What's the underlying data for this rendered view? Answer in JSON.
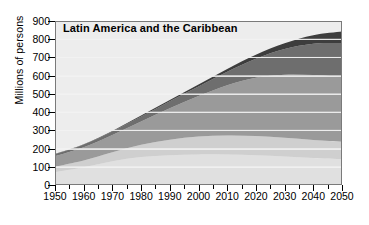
{
  "chart_data": {
    "type": "area",
    "title": "Latin America and the Caribbean",
    "xlabel": "",
    "ylabel": "Millions of persons",
    "xlim": [
      1950,
      2050
    ],
    "ylim": [
      0,
      900
    ],
    "ytick_step": 100,
    "xtick_step": 10,
    "grid": true,
    "stacked": true,
    "legend": "none",
    "xticks": [
      "1950",
      "1960",
      "1970",
      "1980",
      "1990",
      "2000",
      "2010",
      "2020",
      "2030",
      "2040",
      "2050"
    ],
    "yticks": [
      "0",
      "100",
      "200",
      "300",
      "400",
      "500",
      "600",
      "700",
      "800",
      "900"
    ],
    "x": [
      1950,
      1960,
      1970,
      1980,
      1990,
      2000,
      2010,
      2020,
      2030,
      2040,
      2050
    ],
    "series": [
      {
        "name": "age-0-14",
        "color": "#e0e0e0",
        "values": [
          70,
          97,
          130,
          153,
          163,
          168,
          167,
          163,
          156,
          148,
          142
        ]
      },
      {
        "name": "age-15-24",
        "color": "#cfcfcf",
        "values": [
          31,
          38,
          50,
          68,
          86,
          98,
          105,
          106,
          103,
          99,
          96
        ]
      },
      {
        "name": "age-25-59",
        "color": "#9a9a9a",
        "values": [
          57,
          72,
          94,
          127,
          172,
          222,
          276,
          320,
          346,
          356,
          355
        ]
      },
      {
        "name": "age-60-79",
        "color": "#6e6e6e",
        "values": [
          11,
          15,
          20,
          28,
          39,
          53,
          74,
          104,
          141,
          172,
          186
        ]
      },
      {
        "name": "age-80-plus",
        "color": "#3d3d3d",
        "values": [
          2,
          2,
          3,
          5,
          7,
          10,
          15,
          22,
          32,
          47,
          63
        ]
      }
    ],
    "totals": [
      171,
      224,
      297,
      381,
      467,
      551,
      637,
      715,
      778,
      822,
      842
    ],
    "colors": {
      "plot_background": "#ededed",
      "gridline": "#f2f2f2",
      "axis": "#000000",
      "page_background": "#ffffff"
    }
  }
}
